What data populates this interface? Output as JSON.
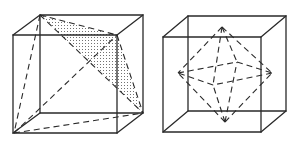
{
  "figure": {
    "panels": [
      {
        "id": "left",
        "label": "Cube with inscribed tetrahedron",
        "cube": {
          "front_face": [
            [
              13,
              35
            ],
            [
              117,
              35
            ],
            [
              117,
              133
            ],
            [
              13,
              133
            ]
          ],
          "back_face": [
            [
              40,
              15
            ],
            [
              143,
              15
            ],
            [
              143,
              113
            ],
            [
              40,
              113
            ]
          ]
        },
        "dashed_edges": [
          [
            [
              40,
              15
            ],
            [
              14,
              133
            ]
          ],
          [
            [
              40,
              15
            ],
            [
              117,
              35
            ]
          ],
          [
            [
              40,
              15
            ],
            [
              143,
              113
            ]
          ],
          [
            [
              14,
              133
            ],
            [
              117,
              35
            ]
          ],
          [
            [
              14,
              133
            ],
            [
              143,
              113
            ]
          ],
          [
            [
              117,
              35
            ],
            [
              143,
              113
            ]
          ]
        ],
        "shaded_face": [
          [
            40,
            15
          ],
          [
            117,
            35
          ],
          [
            143,
            113
          ]
        ]
      },
      {
        "id": "right",
        "label": "Cube with inscribed octahedron",
        "cube": {
          "front_face": [
            [
              163,
              37
            ],
            [
              261,
              37
            ],
            [
              261,
              132
            ],
            [
              163,
              132
            ]
          ],
          "back_face": [
            [
              188,
              16
            ],
            [
              286,
              16
            ],
            [
              286,
              111
            ],
            [
              188,
              111
            ]
          ]
        },
        "octahedron_vertices": {
          "top": [
            222,
            27
          ],
          "bottom": [
            225,
            122
          ],
          "left": [
            178,
            73
          ],
          "right": [
            272,
            73
          ],
          "back": [
            237,
            62
          ],
          "front": [
            213,
            85
          ]
        }
      }
    ],
    "colors": {
      "line": "#2a2a2a",
      "background": "#ffffff"
    }
  }
}
